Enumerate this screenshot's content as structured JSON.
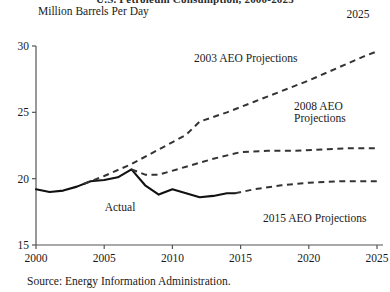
{
  "chart_data": {
    "type": "line",
    "title": "U.S. Petroleum Consumption, 2000-2025",
    "ylabel": "Million Barrels Per Day",
    "xlabel": "",
    "xlim": [
      2000,
      2025
    ],
    "ylim": [
      15,
      30
    ],
    "grid": false,
    "legend_position": "inline-annotations",
    "yticks": [
      15,
      20,
      25,
      30
    ],
    "ytick_labels": [
      "15",
      "20",
      "25",
      "30"
    ],
    "xticks": [
      2000,
      2005,
      2010,
      2015,
      2020,
      2025
    ],
    "xtick_labels": [
      "2000",
      "2005",
      "2010",
      "2015",
      "2020",
      "2025"
    ],
    "source": "Source: Energy Information Administration.",
    "series": [
      {
        "name": "Actual",
        "style": "solid",
        "label": "Actual",
        "x": [
          2000,
          2001,
          2002,
          2003,
          2004,
          2005,
          2006,
          2007,
          2008,
          2009,
          2010,
          2011,
          2012,
          2013,
          2014,
          2014.6
        ],
        "values": [
          19.2,
          19.0,
          19.1,
          19.4,
          19.8,
          19.9,
          20.1,
          20.7,
          19.5,
          18.8,
          19.2,
          18.9,
          18.6,
          18.7,
          18.9,
          18.9
        ]
      },
      {
        "name": "2003 AEO Projections",
        "style": "dashed",
        "label": "2003 AEO Projections",
        "x": [
          2003.5,
          2005,
          2007,
          2009,
          2011,
          2012,
          2014,
          2016,
          2018,
          2020,
          2022,
          2024,
          2025
        ],
        "values": [
          19.6,
          20.2,
          21.1,
          22.2,
          23.3,
          24.3,
          25.0,
          25.8,
          26.6,
          27.4,
          28.3,
          29.2,
          29.6
        ]
      },
      {
        "name": "2008 AEO Projections",
        "style": "dashed",
        "label": "2008 AEO Projections",
        "x": [
          2007,
          2008,
          2009,
          2011,
          2013,
          2015,
          2017,
          2019,
          2021,
          2023,
          2025
        ],
        "values": [
          20.7,
          20.3,
          20.3,
          20.9,
          21.5,
          22.0,
          22.1,
          22.1,
          22.2,
          22.3,
          22.3
        ]
      },
      {
        "name": "2015 AEO Projections",
        "style": "dashed",
        "label": "2015 AEO Projections",
        "x": [
          2014.6,
          2016,
          2018,
          2020,
          2022,
          2024,
          2025
        ],
        "values": [
          18.9,
          19.2,
          19.5,
          19.7,
          19.8,
          19.8,
          19.8
        ]
      }
    ],
    "annotations": [
      {
        "text": "2003 AEO Projections",
        "x_px": 194,
        "y_px": 62,
        "anchor": "start"
      },
      {
        "text": "2008 AEO",
        "x_px": 294,
        "y_px": 110,
        "anchor": "start"
      },
      {
        "text": "Projections",
        "x_px": 294,
        "y_px": 122,
        "anchor": "start"
      },
      {
        "text": "2015 AEO Projections",
        "x_px": 263,
        "y_px": 222,
        "anchor": "start"
      },
      {
        "text": "Actual",
        "x_px": 120,
        "y_px": 211,
        "anchor": "middle"
      },
      {
        "text": "2025",
        "x_px": 358,
        "y_px": 18,
        "anchor": "middle"
      }
    ]
  }
}
